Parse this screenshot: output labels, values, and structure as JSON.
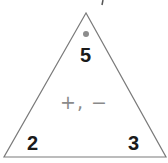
{
  "fact_triangle": {
    "top_number": "5",
    "bottom_left_number": "2",
    "bottom_right_number": "3",
    "operations": "+, −",
    "top_marker": "dot",
    "colors": {
      "outline": "#7a7a7a",
      "numbers": "#1a1a1a",
      "operations": "#8a8a8a",
      "dot": "#8c8c8c"
    }
  }
}
